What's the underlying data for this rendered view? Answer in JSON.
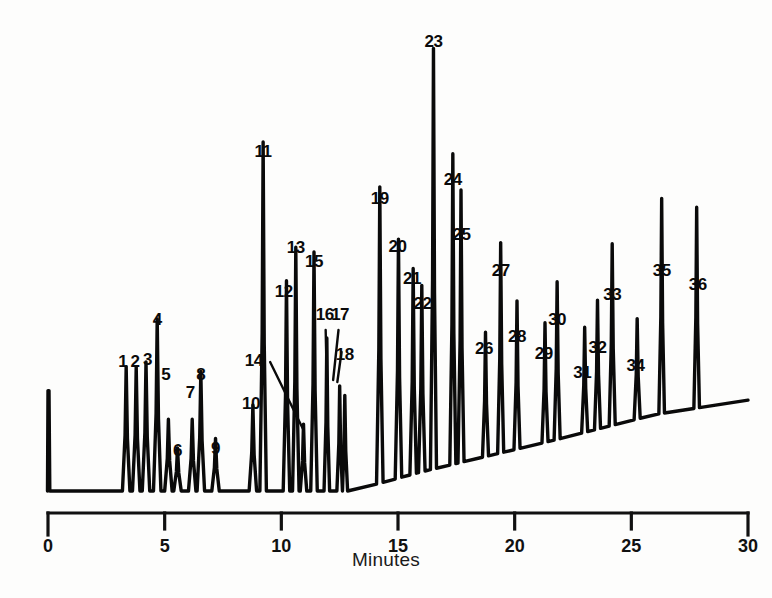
{
  "chart_data": {
    "type": "line",
    "title": "",
    "subtitle": "",
    "xlabel": "Minutes",
    "ylabel": "",
    "xlim": [
      0,
      30
    ],
    "ylim": [
      0,
      100
    ],
    "grid": false,
    "legend": null,
    "xticks": [
      0,
      5,
      10,
      15,
      20,
      25,
      30
    ],
    "xtick_labels": [
      "0",
      "5",
      "10",
      "15",
      "20",
      "25",
      "30"
    ],
    "annotations": [
      "Injection spike at t=0",
      "36 numbered peaks",
      "Baseline drifts upward across the run"
    ],
    "series": [
      {
        "name": "detector response",
        "color": "#0a0a0a",
        "peaks": [
          {
            "id": 1,
            "label": "1",
            "x": 3.35,
            "height": 26,
            "width": 0.16,
            "label_x": 3.2,
            "label_y": 353
          },
          {
            "id": 2,
            "label": "2",
            "x": 3.78,
            "height": 26,
            "width": 0.16,
            "label_x": 3.73,
            "label_y": 353
          },
          {
            "id": 3,
            "label": "3",
            "x": 4.2,
            "height": 27,
            "width": 0.16,
            "label_x": 4.26,
            "label_y": 351
          },
          {
            "id": 4,
            "label": "4",
            "x": 4.68,
            "height": 36,
            "width": 0.16,
            "label_x": 4.68,
            "label_y": 311
          },
          {
            "id": 5,
            "label": "5",
            "x": 5.16,
            "height": 15,
            "width": 0.16,
            "label_x": 5.05,
            "label_y": 366
          },
          {
            "id": 6,
            "label": "6",
            "x": 5.55,
            "height": 9,
            "width": 0.16,
            "label_x": 5.55,
            "label_y": 442
          },
          {
            "id": 7,
            "label": "7",
            "x": 6.18,
            "height": 15,
            "width": 0.16,
            "label_x": 6.1,
            "label_y": 384
          },
          {
            "id": 8,
            "label": "8",
            "x": 6.55,
            "height": 25,
            "width": 0.16,
            "label_x": 6.55,
            "label_y": 366
          },
          {
            "id": 9,
            "label": "9",
            "x": 7.18,
            "height": 11,
            "width": 0.16,
            "label_x": 7.18,
            "label_y": 440
          },
          {
            "id": 10,
            "label": "10",
            "x": 8.78,
            "height": 18,
            "width": 0.16,
            "label_x": 8.7,
            "label_y": 395
          },
          {
            "id": 11,
            "label": "11",
            "x": 9.22,
            "height": 73,
            "width": 0.14,
            "label_x": 9.22,
            "label_y": 143
          },
          {
            "id": 12,
            "label": "12",
            "x": 10.22,
            "height": 44,
            "width": 0.14,
            "label_x": 10.1,
            "label_y": 283
          },
          {
            "id": 13,
            "label": "13",
            "x": 10.62,
            "height": 51,
            "width": 0.14,
            "label_x": 10.62,
            "label_y": 239
          },
          {
            "id": 14,
            "label": "14",
            "x": 10.95,
            "height": 14,
            "width": 0.14,
            "label_x": 8.82,
            "label_y": 352,
            "leader": {
              "from_x": 9.52,
              "from_y": 362,
              "to_x": 10.95,
              "to_y": 430
            }
          },
          {
            "id": 15,
            "label": "15",
            "x": 11.4,
            "height": 50,
            "width": 0.14,
            "label_x": 11.4,
            "label_y": 253
          },
          {
            "id": 16,
            "label": "16",
            "x": 11.95,
            "height": 32,
            "width": 0.12,
            "label_x": 11.86,
            "label_y": 306,
            "leader": {
              "from_x": 11.9,
              "from_y": 330,
              "to_x": 11.97,
              "to_y": 405
            }
          },
          {
            "id": 17,
            "label": "17",
            "x": 12.5,
            "height": 22,
            "width": 0.12,
            "label_x": 12.52,
            "label_y": 306,
            "leader": {
              "from_x": 12.45,
              "from_y": 330,
              "to_x": 12.22,
              "to_y": 380
            }
          },
          {
            "id": 18,
            "label": "18",
            "x": 12.72,
            "height": 20,
            "width": 0.12,
            "label_x": 12.72,
            "label_y": 346,
            "leader": {
              "from_x": 12.58,
              "from_y": 352,
              "to_x": 12.4,
              "to_y": 382
            }
          },
          {
            "id": 19,
            "label": "19",
            "x": 14.22,
            "height": 62,
            "width": 0.14,
            "label_x": 14.22,
            "label_y": 190
          },
          {
            "id": 20,
            "label": "20",
            "x": 15.02,
            "height": 50,
            "width": 0.14,
            "label_x": 14.98,
            "label_y": 238
          },
          {
            "id": 21,
            "label": "21",
            "x": 15.65,
            "height": 43,
            "width": 0.14,
            "label_x": 15.6,
            "label_y": 270
          },
          {
            "id": 22,
            "label": "22",
            "x": 16.02,
            "height": 39,
            "width": 0.14,
            "label_x": 16.05,
            "label_y": 295
          },
          {
            "id": 23,
            "label": "23",
            "x": 16.52,
            "height": 88,
            "width": 0.13,
            "label_x": 16.52,
            "label_y": 33
          },
          {
            "id": 24,
            "label": "24",
            "x": 17.35,
            "height": 65,
            "width": 0.13,
            "label_x": 17.35,
            "label_y": 171
          },
          {
            "id": 25,
            "label": "25",
            "x": 17.7,
            "height": 57,
            "width": 0.13,
            "label_x": 17.72,
            "label_y": 226
          },
          {
            "id": 26,
            "label": "26",
            "x": 18.75,
            "height": 26,
            "width": 0.13,
            "label_x": 18.68,
            "label_y": 340
          },
          {
            "id": 27,
            "label": "27",
            "x": 19.4,
            "height": 44,
            "width": 0.13,
            "label_x": 19.4,
            "label_y": 262
          },
          {
            "id": 28,
            "label": "28",
            "x": 20.1,
            "height": 31,
            "width": 0.13,
            "label_x": 20.1,
            "label_y": 328
          },
          {
            "id": 29,
            "label": "29",
            "x": 21.3,
            "height": 25,
            "width": 0.13,
            "label_x": 21.25,
            "label_y": 345
          },
          {
            "id": 30,
            "label": "30",
            "x": 21.82,
            "height": 33,
            "width": 0.13,
            "label_x": 21.82,
            "label_y": 311
          },
          {
            "id": 31,
            "label": "31",
            "x": 23.0,
            "height": 22,
            "width": 0.13,
            "label_x": 22.9,
            "label_y": 364
          },
          {
            "id": 32,
            "label": "32",
            "x": 23.55,
            "height": 27,
            "width": 0.13,
            "label_x": 23.55,
            "label_y": 339
          },
          {
            "id": 33,
            "label": "33",
            "x": 24.18,
            "height": 38,
            "width": 0.13,
            "label_x": 24.18,
            "label_y": 286
          },
          {
            "id": 34,
            "label": "34",
            "x": 25.25,
            "height": 21,
            "width": 0.13,
            "label_x": 25.18,
            "label_y": 357
          },
          {
            "id": 35,
            "label": "35",
            "x": 26.3,
            "height": 45,
            "width": 0.12,
            "label_x": 26.3,
            "label_y": 262
          },
          {
            "id": 36,
            "label": "36",
            "x": 27.8,
            "height": 42,
            "width": 0.12,
            "label_x": 27.85,
            "label_y": 276
          }
        ],
        "injection_spike": {
          "x": 0.0,
          "height": 21
        },
        "baseline": [
          {
            "x": 0.0,
            "y": 0
          },
          {
            "x": 13.0,
            "y": 0
          },
          {
            "x": 16.0,
            "y": 4
          },
          {
            "x": 22.0,
            "y": 11
          },
          {
            "x": 26.0,
            "y": 16
          },
          {
            "x": 30.0,
            "y": 19
          }
        ]
      }
    ]
  },
  "axis": {
    "title": "Minutes"
  }
}
